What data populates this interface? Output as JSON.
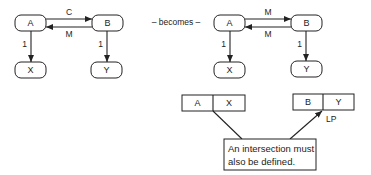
{
  "left_diagram": {
    "nodes": {
      "a": "A",
      "b": "B",
      "x": "X",
      "y": "Y"
    },
    "edges": {
      "a_to_b": "C",
      "b_to_a": "M",
      "a_to_x": "1",
      "b_to_y": "1"
    }
  },
  "connector_text": "– becomes –",
  "right_diagram": {
    "nodes": {
      "a": "A",
      "b": "B",
      "x": "X",
      "y": "Y"
    },
    "edges": {
      "a_to_b": "M",
      "b_to_a": "M",
      "a_to_x": "1",
      "b_to_y": "1"
    }
  },
  "tables": {
    "ax": [
      "A",
      "X"
    ],
    "by": [
      "B",
      "Y"
    ]
  },
  "lp_label": "LP",
  "note": {
    "line1": "An intersection must",
    "line2": "also be defined."
  }
}
